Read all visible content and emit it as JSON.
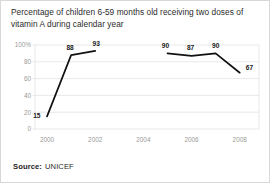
{
  "chart_title": "Percentage of children 6-59 months old receiving two doses of vitamin A during calendar year",
  "source": {
    "label": "Source:",
    "value": "UNICEF"
  },
  "colors": {
    "line": "#111111",
    "grid": "#e2e2e2",
    "axis_text": "#9a9a9a",
    "label_text": "#1a1a1a",
    "card_border": "#d8d8d8",
    "background": "#ffffff"
  },
  "chart_data": {
    "type": "line",
    "title": "Percentage of children 6-59 months old receiving two doses of vitamin A during calendar year",
    "xlabel": "",
    "ylabel": "",
    "xlim": [
      1999.5,
      2008.8
    ],
    "ylim": [
      0,
      100
    ],
    "grid": "horizontal",
    "legend": "none",
    "x_tick_labels": [
      "2000",
      "2002",
      "2004",
      "2006",
      "2008"
    ],
    "x_tick_values": [
      2000,
      2002,
      2004,
      2006,
      2008
    ],
    "y_tick_labels": [
      "0",
      "20",
      "40",
      "60",
      "80",
      "100%"
    ],
    "y_tick_values": [
      0,
      20,
      40,
      60,
      80,
      100
    ],
    "series": [
      {
        "name": "Vitamin A two-dose coverage",
        "points": [
          {
            "x": 2000,
            "y": 15,
            "label": "15"
          },
          {
            "x": 2001,
            "y": 88,
            "label": "88"
          },
          {
            "x": 2002,
            "y": 93,
            "label": "93"
          },
          {
            "x": 2005,
            "y": 90,
            "label": "90"
          },
          {
            "x": 2006,
            "y": 87,
            "label": "87"
          },
          {
            "x": 2007,
            "y": 90,
            "label": "90"
          },
          {
            "x": 2008,
            "y": 67,
            "label": "67"
          }
        ],
        "segments": [
          [
            2000,
            2001,
            2002
          ],
          [
            2005,
            2006,
            2007,
            2008
          ]
        ]
      }
    ]
  }
}
